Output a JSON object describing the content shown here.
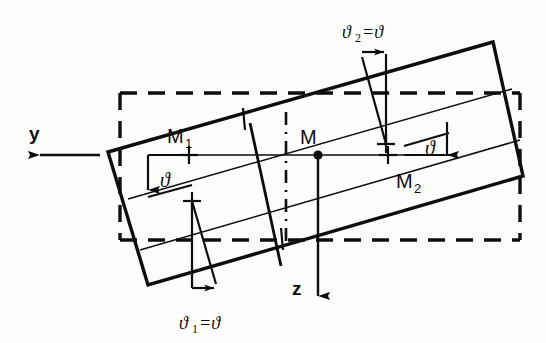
{
  "figure": {
    "background_color": "#fdfdfc",
    "line_color": "#0d0d0d",
    "labels": {
      "axis_y": "y",
      "axis_z": "z",
      "point_m": "M",
      "point_m1_base": "M",
      "point_m1_sub": "1",
      "point_m2_base": "M",
      "point_m2_sub": "2",
      "theta_left": "ϑ",
      "theta_right": "ϑ",
      "theta1_text": "ϑ",
      "theta1_sub": "1",
      "theta1_eq": "=ϑ",
      "theta2_text": "ϑ",
      "theta2_sub": "2",
      "theta2_eq": "=ϑ"
    },
    "geometry": {
      "rotation_angle_deg": 12,
      "rotated_rect_corners": [
        [
          108,
          152
        ],
        [
          493,
          42
        ],
        [
          523,
          176
        ],
        [
          148,
          285
        ]
      ],
      "dashed_rect": {
        "x": 120,
        "y": 93,
        "width": 400,
        "height": 147
      },
      "y_axis": {
        "from": [
          290,
          155
        ],
        "to": [
          28,
          155
        ],
        "arrow": "left"
      },
      "z_axis": {
        "from": [
          318,
          155
        ],
        "to": [
          318,
          300
        ],
        "arrow": "down"
      },
      "horizontal_axis": {
        "from": [
          148,
          155
        ],
        "to": [
          447,
          155
        ]
      },
      "center_point_m": [
        318,
        155
      ],
      "cross_m1": [
        188,
        155
      ],
      "cross_m2": [
        388,
        155
      ]
    }
  }
}
